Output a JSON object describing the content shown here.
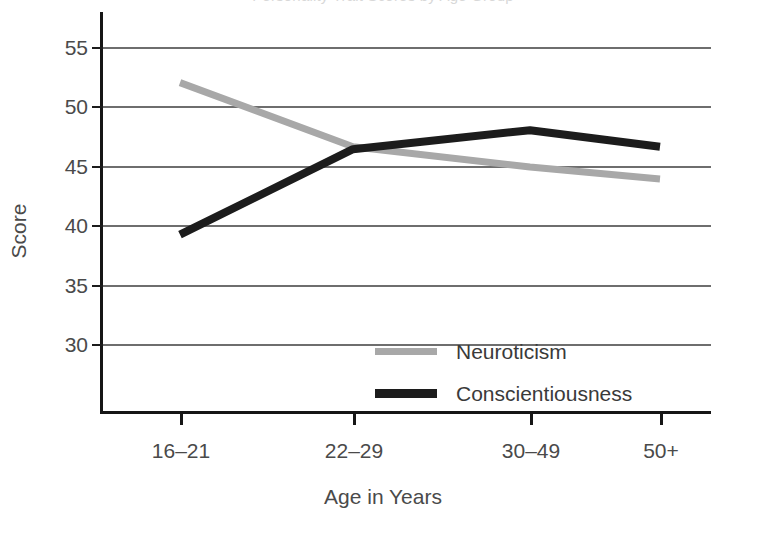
{
  "title": {
    "text": "Personality Trait Scores by Age Group",
    "cropped": true
  },
  "axes": {
    "y": {
      "label": "Score",
      "ticks": [
        "55",
        "50",
        "45",
        "40",
        "35",
        "30"
      ],
      "min": 30,
      "max": 55
    },
    "x": {
      "label": "Age in Years",
      "ticks": [
        "16–21",
        "22–29",
        "30–49",
        "50+"
      ]
    }
  },
  "legend": {
    "items": [
      {
        "name": "Neuroticism",
        "color": "#a8a8a8"
      },
      {
        "name": "Conscientiousness",
        "color": "#1c1c1c"
      }
    ]
  },
  "colors": {
    "neuroticism": "#a8a8a8",
    "conscientiousness": "#1c1c1c",
    "gridline": "#6e6e6e",
    "axis": "#161616",
    "text": "#4a4a4a",
    "background": "#ffffff"
  },
  "chart_data": {
    "type": "line",
    "title": "Personality Trait Scores by Age Group",
    "xlabel": "Age in Years",
    "ylabel": "Score",
    "categories": [
      "16–21",
      "22–29",
      "30–49",
      "50+"
    ],
    "ylim": [
      30,
      55
    ],
    "yticks": [
      30,
      35,
      40,
      45,
      50,
      55
    ],
    "grid": true,
    "legend_position": "inside-center",
    "series": [
      {
        "name": "Neuroticism",
        "color": "#a8a8a8",
        "values": [
          52.0,
          46.6,
          44.9,
          43.9
        ]
      },
      {
        "name": "Conscientiousness",
        "color": "#1c1c1c",
        "values": [
          39.2,
          46.4,
          48.0,
          46.6
        ]
      }
    ]
  }
}
